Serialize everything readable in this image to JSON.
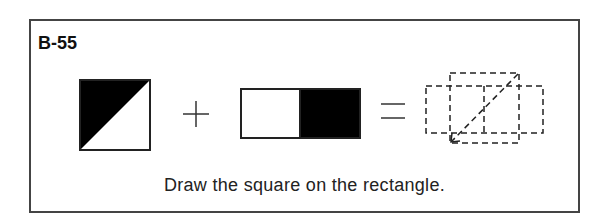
{
  "puzzle": {
    "label": "B-55",
    "instruction": "Draw the square on the rectangle.",
    "operators": [
      "plus",
      "equals"
    ],
    "colors": {
      "ink": "#111111",
      "border": "#444444",
      "fill_dark": "#000000",
      "background": "#ffffff"
    },
    "parts": [
      {
        "name": "square",
        "description": "square split by diagonal, top-left triangle black"
      },
      {
        "name": "rectangle",
        "description": "rectangle split in halves, right half black"
      },
      {
        "name": "result",
        "description": "dashed outline of square over rectangle with dashed diagonal arrow"
      }
    ]
  }
}
